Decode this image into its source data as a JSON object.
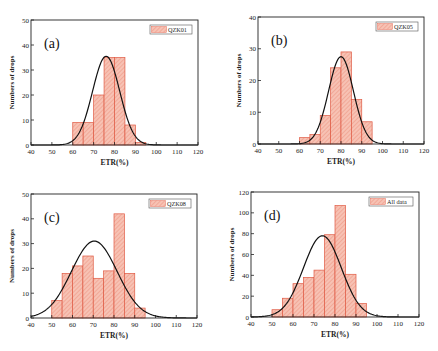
{
  "colors": {
    "bar_fill": "#f7c2b4",
    "bar_stroke": "#e05a44",
    "hatch": "#e8846e",
    "curve": "#111111",
    "axis": "#222222"
  },
  "chart_data": [
    {
      "id": "a",
      "type": "bar",
      "panel_label": "(a)",
      "legend": "QZK01",
      "xlabel": "ETR(%)",
      "ylabel": "Numbers of drops",
      "xlim": [
        40,
        120
      ],
      "ylim": [
        0,
        50
      ],
      "xticks": [
        40,
        50,
        60,
        70,
        80,
        90,
        100,
        110,
        120
      ],
      "yticks": [
        0,
        10,
        20,
        30,
        40,
        50
      ],
      "bin_width": 5,
      "bins": [
        60,
        65,
        70,
        75,
        80,
        85,
        90
      ],
      "values": [
        9,
        9,
        20,
        35,
        35,
        8,
        1
      ],
      "fit": {
        "type": "gaussian",
        "peak": 35.5,
        "mean": 76,
        "sigma": 6.5
      },
      "box": {
        "left": 31,
        "top": 20,
        "right": 198,
        "bottom": 145
      }
    },
    {
      "id": "b",
      "type": "bar",
      "panel_label": "(b)",
      "legend": "QZK05",
      "xlabel": "ETR(%)",
      "ylabel": "Numbers of drops",
      "xlim": [
        40,
        120
      ],
      "ylim": [
        0,
        40
      ],
      "xticks": [
        40,
        50,
        60,
        70,
        80,
        90,
        100,
        110,
        120
      ],
      "yticks": [
        0,
        10,
        20,
        30,
        40
      ],
      "bin_width": 5,
      "bins": [
        60,
        65,
        70,
        75,
        80,
        85,
        90
      ],
      "values": [
        2,
        3,
        9,
        24,
        29,
        14,
        7
      ],
      "fit": {
        "type": "gaussian",
        "peak": 27.5,
        "mean": 80,
        "sigma": 6
      },
      "box": {
        "left": 258,
        "top": 17,
        "right": 424,
        "bottom": 144
      }
    },
    {
      "id": "c",
      "type": "bar",
      "panel_label": "(c)",
      "legend": "QZK08",
      "xlabel": "ETR(%)",
      "ylabel": "Numbers of drops",
      "xlim": [
        40,
        120
      ],
      "ylim": [
        0,
        50
      ],
      "xticks": [
        40,
        50,
        60,
        70,
        80,
        90,
        100,
        110,
        120
      ],
      "yticks": [
        0,
        10,
        20,
        30,
        40,
        50
      ],
      "bin_width": 5,
      "bins": [
        50,
        55,
        60,
        65,
        70,
        75,
        80,
        85,
        90
      ],
      "values": [
        7,
        18,
        21,
        25,
        16,
        19,
        42,
        18,
        4
      ],
      "fit": {
        "type": "gaussian",
        "peak": 31,
        "mean": 70.5,
        "sigma": 11
      },
      "box": {
        "left": 31,
        "top": 194,
        "right": 197,
        "bottom": 318
      }
    },
    {
      "id": "d",
      "type": "bar",
      "panel_label": "(d)",
      "legend": "All data",
      "xlabel": "ETR(%)",
      "ylabel": "Numbers of drops",
      "xlim": [
        40,
        120
      ],
      "ylim": [
        0,
        120
      ],
      "xticks": [
        40,
        50,
        60,
        70,
        80,
        90,
        100,
        110,
        120
      ],
      "yticks": [
        0,
        20,
        40,
        60,
        80,
        100,
        120
      ],
      "bin_width": 5,
      "bins": [
        50,
        55,
        60,
        65,
        70,
        75,
        80,
        85,
        90
      ],
      "values": [
        7,
        18,
        32,
        38,
        45,
        79,
        107,
        41,
        13
      ],
      "fit": {
        "type": "gaussian",
        "peak": 78,
        "mean": 74,
        "sigma": 9
      },
      "box": {
        "left": 251,
        "top": 192,
        "right": 419,
        "bottom": 317
      }
    }
  ]
}
